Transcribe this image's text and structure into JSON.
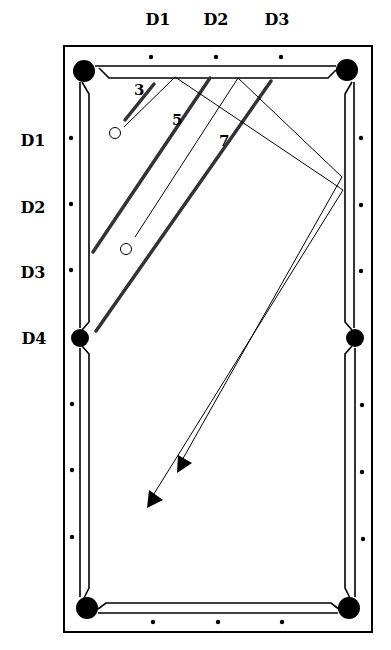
{
  "diagram": {
    "type": "billiards-table-bank-shot",
    "top_diamond_labels": [
      "D1",
      "D2",
      "D3"
    ],
    "left_diamond_labels": [
      "D1",
      "D2",
      "D3",
      "D4"
    ],
    "aim_line_labels": [
      "3",
      "5",
      "7"
    ],
    "colors": {
      "ink": "#000000",
      "aim_line": "#333333",
      "background": "#ffffff"
    },
    "balls": [
      {
        "name": "cue-ball-1",
        "x": 115,
        "y": 133
      },
      {
        "name": "cue-ball-2",
        "x": 126,
        "y": 249
      }
    ],
    "pockets": 6,
    "diamonds_per_long_rail": 6,
    "diamonds_per_short_rail": 3
  }
}
